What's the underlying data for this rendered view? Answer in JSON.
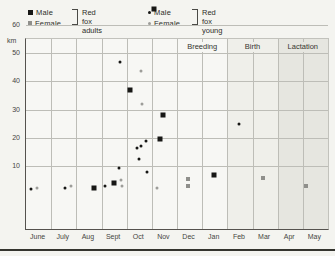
{
  "page": {
    "background": "#f4f4f0",
    "bottom_rule_color": "#35352f"
  },
  "legend": {
    "groups": [
      {
        "name_line1": "Red fox",
        "name_line2": "adults",
        "entries": [
          {
            "symbol": "square-black",
            "label": "Male"
          },
          {
            "symbol": "square-gray",
            "label": "Female"
          }
        ]
      },
      {
        "name_line1": "Red fox",
        "name_line2": "young",
        "entries": [
          {
            "symbol": "dot-black",
            "label": "Male"
          },
          {
            "symbol": "dot-gray",
            "label": "Female"
          }
        ]
      }
    ]
  },
  "chart_data": {
    "type": "scatter",
    "title": "",
    "xlabel": "",
    "ylabel": "km",
    "ylim": [
      0,
      67
    ],
    "y_ticks": [
      10,
      20,
      30,
      40,
      50,
      60
    ],
    "grid": true,
    "months": [
      "June",
      "July",
      "Aug",
      "Sept",
      "Oct",
      "Nov",
      "Dec",
      "Jan",
      "Feb",
      "Mar",
      "Apr",
      "May"
    ],
    "phases": [
      {
        "label": "Breeding",
        "start_month": "Dec",
        "span_months": 2,
        "shading": "none",
        "band_color": null,
        "label_bg": "#f7f7f4"
      },
      {
        "label": "Birth",
        "start_month": "Feb",
        "span_months": 2,
        "shading": "light",
        "band_color": "#efefea",
        "label_bg": "#efefea"
      },
      {
        "label": "Lactation",
        "start_month": "Apr",
        "span_months": 2,
        "shading": "medium",
        "band_color": "#e6e6e0",
        "label_bg": "#e6e6e0"
      }
    ],
    "series": [
      {
        "name": "Red fox adults — male",
        "symbol": "square-black",
        "color": "#171715",
        "points": [
          {
            "month": "Aug",
            "km": 2.5,
            "dx": 0.71
          },
          {
            "month": "Sept",
            "km": 4,
            "dx": 0.48
          },
          {
            "month": "Oct",
            "km": 37,
            "dx": 0.15
          },
          {
            "month": "Nov",
            "km": 65.5,
            "dx": 0.1
          },
          {
            "month": "Nov",
            "km": 28,
            "dx": 0.44
          },
          {
            "month": "Nov",
            "km": 19.5,
            "dx": 0.34
          },
          {
            "month": "Jan",
            "km": 7,
            "dx": 0.48
          }
        ]
      },
      {
        "name": "Red fox adults — female",
        "symbol": "square-gray",
        "color": "#8f8f8b",
        "points": [
          {
            "month": "Dec",
            "km": 5.5,
            "dx": 0.45
          },
          {
            "month": "Dec",
            "km": 3,
            "dx": 0.45
          },
          {
            "month": "Mar",
            "km": 6,
            "dx": 0.4
          },
          {
            "month": "May",
            "km": 3,
            "dx": 0.12
          }
        ]
      },
      {
        "name": "Red fox young — male",
        "symbol": "dot-black",
        "color": "#171715",
        "points": [
          {
            "month": "June",
            "km": 2,
            "dx": 0.21
          },
          {
            "month": "July",
            "km": 2.5,
            "dx": 0.56
          },
          {
            "month": "Sept",
            "km": 3,
            "dx": 0.15
          },
          {
            "month": "Sept",
            "km": 9.5,
            "dx": 0.7
          },
          {
            "month": "Sept",
            "km": 47,
            "dx": 0.75
          },
          {
            "month": "Oct",
            "km": 8,
            "dx": 0.81
          },
          {
            "month": "Oct",
            "km": 12.5,
            "dx": 0.48
          },
          {
            "month": "Oct",
            "km": 16.5,
            "dx": 0.42
          },
          {
            "month": "Oct",
            "km": 17,
            "dx": 0.57
          },
          {
            "month": "Oct",
            "km": 19,
            "dx": 0.75
          },
          {
            "month": "Feb",
            "km": 25,
            "dx": 0.48
          }
        ]
      },
      {
        "name": "Red fox young — female",
        "symbol": "dot-gray",
        "color": "#9d9d99",
        "points": [
          {
            "month": "June",
            "km": 2.5,
            "dx": 0.42
          },
          {
            "month": "July",
            "km": 3,
            "dx": 0.8
          },
          {
            "month": "Sept",
            "km": 5,
            "dx": 0.78
          },
          {
            "month": "Sept",
            "km": 3,
            "dx": 0.82
          },
          {
            "month": "Oct",
            "km": 43.5,
            "dx": 0.55
          },
          {
            "month": "Oct",
            "km": 32,
            "dx": 0.6
          },
          {
            "month": "Nov",
            "km": 2.5,
            "dx": 0.22
          }
        ]
      }
    ]
  }
}
